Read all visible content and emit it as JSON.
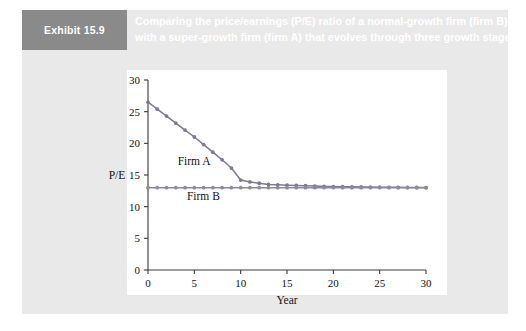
{
  "exhibit": {
    "tag": "Exhibit 15.9",
    "caption_line1": "Comparing the price/earnings (P/E) ratio of a normal-growth firm (firm B)",
    "caption_line2": "with a super-growth firm (firm A) that evolves through three growth stages"
  },
  "colors": {
    "panel_background": "#e9e9e9",
    "tag_background": "#8a8a8a",
    "tag_text": "#ffffff",
    "caption_text": "#ffffff",
    "plot_background": "#ffffff",
    "axis": "#3a3a3a",
    "firm_a_line": "#7d7a8c",
    "firm_b_line": "#8e8b9c"
  },
  "chart_data": {
    "type": "line",
    "title": "",
    "xlabel": "Year",
    "ylabel": "P/E",
    "xlim": [
      0,
      30
    ],
    "ylim": [
      0,
      30
    ],
    "xticks": [
      0,
      5,
      10,
      15,
      20,
      25,
      30
    ],
    "yticks": [
      0,
      5,
      10,
      15,
      20,
      25,
      30
    ],
    "xticklabels": [
      "0",
      "5",
      "10",
      "15",
      "20",
      "25",
      "30"
    ],
    "yticklabels": [
      "0",
      "5",
      "10",
      "15",
      "20",
      "25",
      "30"
    ],
    "grid": false,
    "legend_position": "inline-annotation",
    "x": [
      0,
      1,
      2,
      3,
      4,
      5,
      6,
      7,
      8,
      9,
      10,
      11,
      12,
      13,
      14,
      15,
      16,
      17,
      18,
      19,
      20,
      21,
      22,
      23,
      24,
      25,
      26,
      27,
      28,
      29,
      30
    ],
    "series": [
      {
        "name": "Firm A",
        "label_x": 3.2,
        "label_y": 16.6,
        "values": [
          26.5,
          25.4,
          24.3,
          23.2,
          22.1,
          21.0,
          19.8,
          18.6,
          17.4,
          16.1,
          14.2,
          13.9,
          13.7,
          13.5,
          13.45,
          13.4,
          13.35,
          13.3,
          13.25,
          13.2,
          13.18,
          13.16,
          13.14,
          13.12,
          13.1,
          13.08,
          13.06,
          13.05,
          13.04,
          13.03,
          13.02
        ]
      },
      {
        "name": "Firm B",
        "label_x": 4.2,
        "label_y": 11.0,
        "values": [
          13,
          13,
          13,
          13,
          13,
          13,
          13,
          13,
          13,
          13,
          13,
          13,
          13,
          13,
          13,
          13,
          13,
          13,
          13,
          13,
          13,
          13,
          13,
          13,
          13,
          13,
          13,
          13,
          13,
          13,
          13
        ]
      }
    ]
  }
}
